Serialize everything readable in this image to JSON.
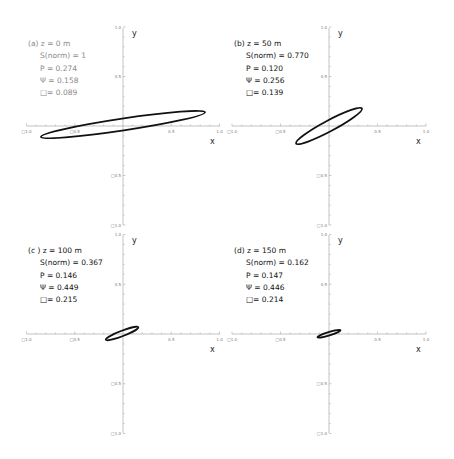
{
  "chart_data": [
    {
      "type": "line",
      "panel": "a",
      "title": "(a) z = 0 m",
      "annotations": [
        "S(norm) = 1",
        "P = 0.274",
        "Ψ = 0.158",
        "□= 0.089"
      ],
      "xlabel": "x",
      "ylabel": "y",
      "xlim": [
        -1.0,
        1.0
      ],
      "ylim": [
        -1.0,
        1.0
      ],
      "xticks": [
        "□1.0",
        "□0.5",
        "0.5",
        "1.0"
      ],
      "yticks": [
        "1.0",
        "0.5",
        "□0.5",
        "□1.0"
      ],
      "text_color": "#8a8a8a",
      "ellipse": {
        "cx": 0.0,
        "cy": 0.015,
        "a": 0.86,
        "b": 0.06,
        "angle_deg": 8.5
      }
    },
    {
      "type": "line",
      "panel": "b",
      "title": "(b)  z = 50 m",
      "annotations": [
        "S(norm) = 0.770",
        "P = 0.120",
        "Ψ = 0.256",
        "□= 0.139"
      ],
      "xlabel": "x",
      "ylabel": "y",
      "xlim": [
        -1.0,
        1.0
      ],
      "ylim": [
        -1.0,
        1.0
      ],
      "xticks": [
        "□1.0",
        "□0.5",
        "0.5",
        "1.0"
      ],
      "yticks": [
        "1.0",
        "0.5",
        "□0.5",
        "□1.0"
      ],
      "text_color": "#111111",
      "ellipse": {
        "cx": 0.0,
        "cy": 0.0,
        "a": 0.385,
        "b": 0.055,
        "angle_deg": 28
      }
    },
    {
      "type": "line",
      "panel": "c",
      "title": "(c ) z = 100 m",
      "annotations": [
        "S(norm) = 0.367",
        "P = 0.146",
        "Ψ = 0.449",
        "□= 0.215"
      ],
      "xlabel": "x",
      "ylabel": "y",
      "xlim": [
        -1.0,
        1.0
      ],
      "ylim": [
        -1.0,
        1.0
      ],
      "xticks": [
        "□1.0",
        "□0.5",
        "0.5",
        "1.0"
      ],
      "yticks": [
        "1.0",
        "0.5",
        "□0.5",
        "□1.0"
      ],
      "text_color": "#111111",
      "ellipse": {
        "cx": -0.01,
        "cy": 0.005,
        "a": 0.18,
        "b": 0.027,
        "angle_deg": 21
      }
    },
    {
      "type": "line",
      "panel": "d",
      "title": "(d) z = 150 m",
      "annotations": [
        "S(norm) = 0.162",
        "P = 0.147",
        "Ψ = 0.446",
        "□= 0.214"
      ],
      "xlabel": "x",
      "ylabel": "y",
      "xlim": [
        -1.0,
        1.0
      ],
      "ylim": [
        -1.0,
        1.0
      ],
      "xticks": [
        "□1.0",
        "□0.5",
        "0.5",
        "1.0"
      ],
      "yticks": [
        "1.0",
        "0.5",
        "□0.5",
        "□1.0"
      ],
      "text_color": "#111111",
      "ellipse": {
        "cx": 0.0,
        "cy": 0.003,
        "a": 0.125,
        "b": 0.017,
        "angle_deg": 17
      }
    }
  ],
  "panels": [
    {
      "title": "(a) z = 0 m",
      "lines": [
        "S(norm) = 1",
        "P = 0.274",
        "Ψ = 0.158",
        "□= 0.089"
      ],
      "xlabel": "x",
      "ylabel": "y"
    },
    {
      "title": "(b)  z = 50 m",
      "lines": [
        "S(norm) = 0.770",
        "P = 0.120",
        "Ψ = 0.256",
        "□= 0.139"
      ],
      "xlabel": "x",
      "ylabel": "y"
    },
    {
      "title": "(c ) z = 100 m",
      "lines": [
        "S(norm) = 0.367",
        "P = 0.146",
        "Ψ = 0.449",
        "□= 0.215"
      ],
      "xlabel": "x",
      "ylabel": "y"
    },
    {
      "title": "(d) z = 150 m",
      "lines": [
        "S(norm) = 0.162",
        "P = 0.147",
        "Ψ = 0.446",
        "□= 0.214"
      ],
      "xlabel": "x",
      "ylabel": "y"
    }
  ],
  "ticks": {
    "x": [
      "□1.0",
      "□0.5",
      "0.5",
      "1.0"
    ],
    "y": [
      "1.0",
      "0.5",
      "□0.5",
      "□1.0"
    ]
  }
}
